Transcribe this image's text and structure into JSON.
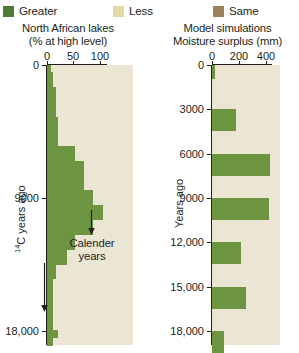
{
  "legend": {
    "items": [
      {
        "label": "Greater",
        "color": "#4f7a33",
        "icon": "legend-swatch-greater"
      },
      {
        "label": "Less",
        "color": "#e3d9a8",
        "icon": "legend-swatch-less"
      },
      {
        "label": "Same",
        "color": "#9c8059",
        "icon": "legend-swatch-same"
      }
    ]
  },
  "annotation": {
    "line1": "Calender",
    "line2": "years"
  },
  "colors": {
    "bar": "#6d9541",
    "plot_background": "#ebe5d4",
    "axis": "#231f20"
  },
  "chart_data": [
    {
      "id": "north-african-lakes",
      "type": "bar",
      "orientation": "horizontal",
      "title": "North African lakes",
      "subtitle": "(% at high level)",
      "xlabel": "% at high level",
      "ylabel": "14C years ago",
      "ylabel_display": "C years ago",
      "ylabel_superscript": "14",
      "xlim": [
        0,
        130
      ],
      "xticks": [
        0,
        50,
        100
      ],
      "xtick_labels": [
        "0",
        "50",
        "100"
      ],
      "ylim": [
        0,
        19000
      ],
      "yticks": [
        0,
        9000,
        18000
      ],
      "ytick_labels": [
        "0",
        "9000",
        "18,000"
      ],
      "grid": false,
      "legend_position": "top",
      "categories": [
        0,
        500,
        1000,
        1500,
        2000,
        2500,
        3000,
        3500,
        4000,
        4500,
        5000,
        5500,
        6000,
        6500,
        7000,
        7500,
        8000,
        8500,
        9000,
        9500,
        10000,
        10500,
        11000,
        11500,
        12000,
        12500,
        13000,
        13500,
        14000,
        14500,
        15000,
        15500,
        16000,
        16500,
        17000,
        17500,
        18000,
        18500
      ],
      "values": [
        6,
        9,
        9,
        13,
        13,
        13,
        13,
        17,
        17,
        17,
        17,
        43,
        43,
        56,
        56,
        56,
        56,
        70,
        70,
        84,
        84,
        70,
        70,
        43,
        43,
        30,
        30,
        13,
        13,
        9,
        9,
        9,
        9,
        9,
        9,
        9,
        17,
        9
      ]
    },
    {
      "id": "model-simulations",
      "type": "bar",
      "orientation": "horizontal",
      "title": "Model simulations",
      "subtitle": "Moisture surplus (mm)",
      "xlabel": "Moisture surplus (mm)",
      "ylabel": "Years ago",
      "xlim": [
        0,
        500
      ],
      "xticks": [
        0,
        200,
        400
      ],
      "xtick_labels": [
        "0",
        "200",
        "400"
      ],
      "ylim": [
        0,
        19000
      ],
      "yticks": [
        0,
        3000,
        6000,
        9000,
        12000,
        15000,
        18000
      ],
      "ytick_labels": [
        "0",
        "3000",
        "6000",
        "9000",
        "12,000",
        "15,000",
        "18,000"
      ],
      "grid": false,
      "legend_position": "top",
      "categories": [
        0,
        3000,
        6000,
        9000,
        12000,
        15000,
        18000
      ],
      "values": [
        25,
        175,
        430,
        420,
        215,
        250,
        90
      ]
    }
  ]
}
